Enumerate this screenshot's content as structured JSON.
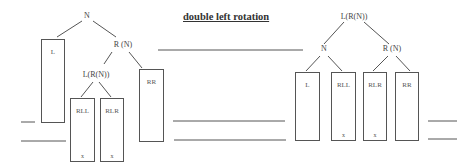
{
  "title": "double left rotation",
  "before": {
    "nodes": {
      "root": "N",
      "right": "R (N)",
      "right_left": "L(R(N))"
    },
    "subtrees": {
      "L": {
        "label": "L",
        "mark": ""
      },
      "RLL": {
        "label": "RLL",
        "mark": "x"
      },
      "RLR": {
        "label": "RLR",
        "mark": "x"
      },
      "RR": {
        "label": "RR",
        "mark": ""
      }
    }
  },
  "after": {
    "nodes": {
      "root": "L(R(N))",
      "left": "N",
      "right": "R (N)"
    },
    "subtrees": {
      "L": {
        "label": "L",
        "mark": ""
      },
      "RLL": {
        "label": "RLL",
        "mark": "x"
      },
      "RLR": {
        "label": "RLR",
        "mark": "x"
      },
      "RR": {
        "label": "RR",
        "mark": ""
      }
    }
  },
  "colors": {
    "line": "#555555",
    "text": "#333333",
    "background": "#ffffff"
  }
}
